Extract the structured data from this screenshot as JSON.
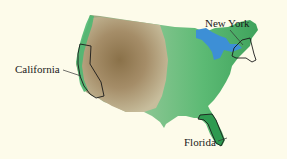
{
  "map": {
    "title": "Relief map of the contiguous United States",
    "background_color": "#fdfbea",
    "colors": {
      "lowland_green": "#3fae5e",
      "mid_green": "#7cc389",
      "highland_brown": "#8f7650",
      "light_tan": "#c9bd9a",
      "water_blue": "#3d8fd6",
      "state_outline": "#1a1a1a"
    },
    "labels": [
      {
        "name": "California",
        "state": "California"
      },
      {
        "name": "New York",
        "state": "New York"
      },
      {
        "name": "Florida",
        "state": "Florida"
      }
    ]
  }
}
